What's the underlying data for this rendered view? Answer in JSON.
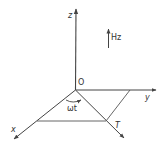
{
  "diagram": {
    "type": "coordinate-axes-3d",
    "colors": {
      "line": "#444444",
      "background": "#ffffff"
    },
    "labels": {
      "z_axis": "z",
      "y_axis": "y",
      "x_axis": "x",
      "origin": "O",
      "field": "Hz",
      "angle": "ωt",
      "point_t": "T"
    }
  }
}
